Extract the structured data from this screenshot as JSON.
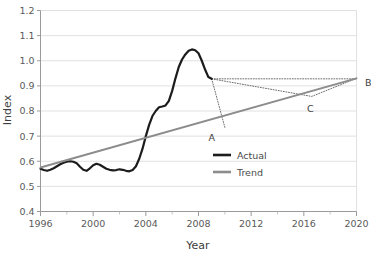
{
  "chart_data": {
    "type": "line",
    "title": "",
    "xlabel": "Year",
    "ylabel": "Index",
    "xlim": [
      1996,
      2020
    ],
    "ylim": [
      0.4,
      1.2
    ],
    "grid": "horizontal",
    "legend_position": "center-right-inside",
    "xticks": [
      1996,
      2000,
      2004,
      2008,
      2012,
      2016,
      2020
    ],
    "xtick_labels": [
      "1996",
      "2000",
      "2004",
      "2008",
      "2012",
      "2016",
      "2020"
    ],
    "xminor_ticks": [
      1998,
      2002,
      2006,
      2010,
      2014,
      2018
    ],
    "yticks": [
      0.4,
      0.5,
      0.6,
      0.7,
      0.8,
      0.9,
      1.0,
      1.1,
      1.2
    ],
    "ytick_labels": [
      "0.4",
      "0.5",
      "0.6",
      "0.7",
      "0.8",
      "0.9",
      "1.0",
      "1.1",
      "1.2"
    ],
    "series": [
      {
        "name": "Actual",
        "color": "#1c1c1c",
        "x": [
          1996.0,
          1996.25,
          1996.5,
          1996.75,
          1997.0,
          1997.25,
          1997.5,
          1997.75,
          1998.0,
          1998.25,
          1998.5,
          1998.75,
          1999.0,
          1999.25,
          1999.5,
          1999.75,
          2000.0,
          2000.25,
          2000.5,
          2000.75,
          2001.0,
          2001.25,
          2001.5,
          2001.75,
          2002.0,
          2002.25,
          2002.5,
          2002.75,
          2003.0,
          2003.25,
          2003.5,
          2003.75,
          2004.0,
          2004.25,
          2004.5,
          2004.75,
          2005.0,
          2005.25,
          2005.5,
          2005.75,
          2006.0,
          2006.25,
          2006.5,
          2006.75,
          2007.0,
          2007.25,
          2007.5,
          2007.75,
          2008.0,
          2008.25,
          2008.5,
          2008.75,
          2009.0
        ],
        "y": [
          0.57,
          0.565,
          0.562,
          0.566,
          0.572,
          0.58,
          0.588,
          0.594,
          0.598,
          0.6,
          0.598,
          0.592,
          0.578,
          0.566,
          0.562,
          0.572,
          0.584,
          0.59,
          0.586,
          0.578,
          0.57,
          0.566,
          0.564,
          0.565,
          0.568,
          0.566,
          0.562,
          0.56,
          0.565,
          0.58,
          0.61,
          0.65,
          0.7,
          0.745,
          0.78,
          0.8,
          0.815,
          0.818,
          0.822,
          0.84,
          0.88,
          0.93,
          0.975,
          1.005,
          1.025,
          1.04,
          1.045,
          1.042,
          1.03,
          1.0,
          0.965,
          0.935,
          0.928
        ]
      },
      {
        "name": "Trend",
        "color": "#8c8c8c",
        "x": [
          1996,
          2020
        ],
        "y": [
          0.575,
          0.93
        ]
      }
    ],
    "legend": [
      {
        "label": "Actual",
        "color": "#1c1c1c"
      },
      {
        "label": "Trend",
        "color": "#8c8c8c"
      }
    ],
    "annotations": [
      {
        "label": "A",
        "x": 2010.0,
        "y": 0.735,
        "label_dx": -1.0,
        "label_dy": -0.028
      },
      {
        "label": "B",
        "x": 2020.0,
        "y": 0.928,
        "label_dx": 0.9,
        "label_dy": 0.0
      },
      {
        "label": "C",
        "x": 2016.6,
        "y": 0.858,
        "label_dx": -0.1,
        "label_dy": -0.035
      }
    ],
    "annotation_lines": [
      {
        "name": "drop-to-trend",
        "from": [
          2009.0,
          0.928
        ],
        "to": [
          2010.0,
          0.735
        ],
        "style": "dotted"
      },
      {
        "name": "flat-to-B",
        "from": [
          2009.0,
          0.928
        ],
        "to": [
          2020.0,
          0.928
        ],
        "style": "dotted"
      },
      {
        "name": "recovery-to-B",
        "from": [
          2009.0,
          0.928
        ],
        "to": [
          2020.0,
          0.93
        ],
        "style": "dotted",
        "via": [
          2016.6,
          0.858
        ]
      }
    ]
  }
}
